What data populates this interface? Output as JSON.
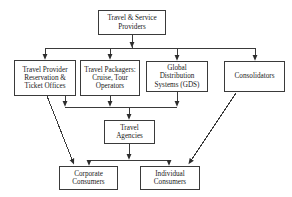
{
  "diagram": {
    "type": "flowchart",
    "background_color": "#ffffff",
    "line_color": "#3a3a3a",
    "text_color": "#1a1a1a",
    "nodes": [
      {
        "id": "providers",
        "label": "Travel & Service\nProviders",
        "level": 1
      },
      {
        "id": "reservation",
        "label": "Travel Provider\nReservation &\nTicket Offices",
        "level": 2
      },
      {
        "id": "packagers",
        "label": "Travel Packagers:\nCruise, Tour\nOperators",
        "level": 2
      },
      {
        "id": "gds",
        "label": "Global Distribution\nSystems (GDS)",
        "level": 2
      },
      {
        "id": "consolidators",
        "label": "Consolidators",
        "level": 2
      },
      {
        "id": "agencies",
        "label": "Travel\nAgencies",
        "level": 3
      },
      {
        "id": "corporate",
        "label": "Corporate\nConsumers",
        "level": 4
      },
      {
        "id": "individual",
        "label": "Individual\nConsumers",
        "level": 4
      }
    ],
    "edges": [
      {
        "from": "providers",
        "to": "reservation",
        "style": "orthogonal"
      },
      {
        "from": "providers",
        "to": "packagers",
        "style": "orthogonal"
      },
      {
        "from": "providers",
        "to": "gds",
        "style": "orthogonal"
      },
      {
        "from": "providers",
        "to": "consolidators",
        "style": "orthogonal"
      },
      {
        "from": "reservation",
        "to": "agencies",
        "style": "orthogonal"
      },
      {
        "from": "packagers",
        "to": "agencies",
        "style": "orthogonal"
      },
      {
        "from": "gds",
        "to": "agencies",
        "style": "orthogonal"
      },
      {
        "from": "reservation",
        "to": "corporate",
        "style": "diagonal"
      },
      {
        "from": "consolidators",
        "to": "individual",
        "style": "diagonal"
      },
      {
        "from": "agencies",
        "to": "corporate",
        "style": "orthogonal"
      },
      {
        "from": "agencies",
        "to": "individual",
        "style": "orthogonal"
      }
    ]
  }
}
